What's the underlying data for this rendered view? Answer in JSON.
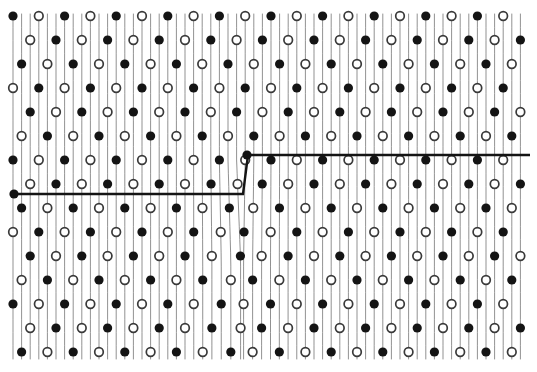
{
  "figure": {
    "title": "Edge dislocation in a crystal lattice",
    "background_color": "#ffffff",
    "ink_color": "#1a1a1a",
    "plane_line_color": "#6e6e6e",
    "atom_filled_color": "#141414",
    "atom_open_stroke_color": "#3a3a3a",
    "atom_open_fill_color": "#ffffff"
  },
  "lattice": {
    "region": {
      "x": 13,
      "y": 14,
      "width": 513,
      "height": 345
    },
    "plane_count": 60,
    "plane_spacing": 8.6,
    "plane_line_width": 0.9,
    "atom_radius_filled": 4.6,
    "atom_radius_open": 4.3,
    "atom_open_stroke_width": 1.7,
    "atom_row_spacing": 24.0,
    "atom_column_period": 3,
    "atom_row_shift": -1,
    "atom_rows": 15,
    "dislocation": {
      "core_x": 243,
      "core_y": 155,
      "bend_top_y": 160,
      "bend_bottom_y": 260,
      "max_shift": 5.0,
      "affected_plane_span": 7
    }
  },
  "slip_line": {
    "label": "slip step line",
    "stroke_width": 2.4,
    "color": "#141414",
    "left_segment": {
      "x1": 13,
      "y1": 194,
      "x2": 243,
      "y2": 194
    },
    "riser_segment": {
      "x1": 243,
      "y1": 194,
      "x2": 248,
      "y2": 155
    },
    "right_segment": {
      "x1": 248,
      "y1": 155,
      "x2": 530,
      "y2": 155
    },
    "left_end_marker": {
      "x": 14,
      "y": 194,
      "type": "filled"
    },
    "core_marker": {
      "x": 247,
      "y": 155,
      "type": "filled"
    }
  },
  "chart_data": {
    "type": "scatter",
    "title": "Edge dislocation in a crystal lattice",
    "subtitle": "",
    "xlabel": "",
    "ylabel": "",
    "xlim": [
      0,
      537
    ],
    "ylim": [
      0,
      372
    ],
    "grid": false,
    "legend_position": "none",
    "series": [
      {
        "name": "filled atoms",
        "marker": "filled-circle",
        "color": "#141414"
      },
      {
        "name": "open atoms",
        "marker": "open-circle",
        "color": "#ffffff"
      },
      {
        "name": "lattice planes",
        "marker": "vertical-line",
        "color": "#6e6e6e"
      },
      {
        "name": "slip step line",
        "marker": "polyline",
        "color": "#141414"
      }
    ],
    "annotations": [
      {
        "text": "dislocation core",
        "x": 245,
        "y": 155
      },
      {
        "text": "slip plane step",
        "x": 243,
        "y": 194
      }
    ]
  }
}
